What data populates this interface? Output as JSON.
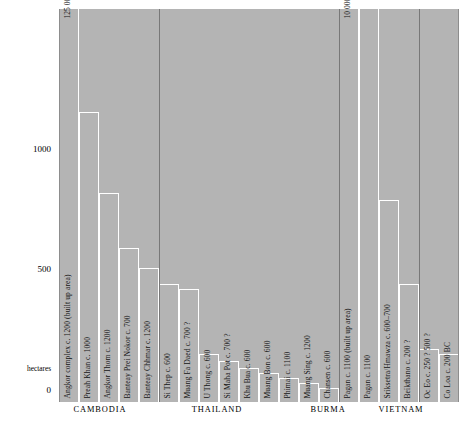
{
  "chart_data": {
    "type": "bar",
    "title": "",
    "xlabel": "",
    "ylabel": "hectares",
    "ylim": [
      0,
      1300
    ],
    "yticks": [
      0,
      500,
      1000
    ],
    "ytick_labels": [
      "0",
      "500",
      "1000"
    ],
    "grid": false,
    "legend": null,
    "categories": [
      "Angkor complex c. 1200  (built up area)",
      "Preah Khan c. 1000",
      "Angkor Thom c. 1200",
      "Banteay Prei Nokor c. 700",
      "Banteay Chhmar c. 1200",
      "Si Thep c. 600",
      "Muang Fa Daed c. 700 ?",
      "U Thong c. 600",
      "Si Maha Pot c. 700 ?",
      "Khu Bua c. 600",
      "Muang Bon c. 600",
      "Phimai c. 1100",
      "Muang Sing c. 1200",
      "Chansen c. 600",
      "Pagan c. 1100  (built up area)",
      "Pagan c. 1100",
      "Sriksetra/Hmawza c. 600–700",
      "Beikthano c. 200 ?",
      "Oc Eo c. 250 ? 500 ?",
      "Co Loa c. 200 BC"
    ],
    "values": [
      1300,
      1210,
      870,
      640,
      560,
      490,
      470,
      200,
      170,
      140,
      120,
      100,
      80,
      60,
      1300,
      1300,
      840,
      490,
      220,
      200
    ],
    "values_note": "Bar heights in hectares read from the axis; the two arrow-annotated bars run off the top of the plot.",
    "annotations": [
      {
        "text": "125 000 hectares→",
        "target": "Angkor complex c. 1200  (built up area)"
      },
      {
        "text": "10 000 hectares→",
        "target": "Pagan c. 1100  (built up area)"
      }
    ],
    "groups": [
      {
        "name": "CAMBODIA",
        "count": 5
      },
      {
        "name": "THAILAND",
        "count": 9
      },
      {
        "name": "BURMA",
        "count": 4
      },
      {
        "name": "VIETNAM",
        "count": 2
      }
    ],
    "colors": {
      "plot_background": "#b4b4b4",
      "bar_outline": "#ffffff",
      "separator": "#787878",
      "text": "#141414",
      "page_background": "#ffffff"
    }
  },
  "axis": {
    "y_title": "hectares",
    "tick_0": "0",
    "tick_500": "500",
    "tick_1000": "1000"
  },
  "annotations": {
    "angkor": "125 000 hectares→",
    "pagan": "10 000 hectares→"
  },
  "groups": {
    "cambodia": "CAMBODIA",
    "thailand": "THAILAND",
    "burma": "BURMA",
    "vietnam": "VIETNAM"
  },
  "bars": [
    {
      "label": "Angkor complex c. 1200  (built up area)"
    },
    {
      "label": "Preah Khan c. 1000"
    },
    {
      "label": "Angkor Thom c. 1200"
    },
    {
      "label": "Banteay Prei Nokor c. 700"
    },
    {
      "label": "Banteay Chhmar c. 1200"
    },
    {
      "label": "Si Thep c. 600"
    },
    {
      "label": "Muang Fa Daed c. 700 ?"
    },
    {
      "label": "U Thong c. 600"
    },
    {
      "label": "Si Maha Pot c. 700 ?"
    },
    {
      "label": "Khu Bua c. 600"
    },
    {
      "label": "Muang Bon c. 600"
    },
    {
      "label": "Phimai c. 1100"
    },
    {
      "label": "Muang Sing c. 1200"
    },
    {
      "label": "Chansen c. 600"
    },
    {
      "label": "Pagan c. 1100  (built up area)"
    },
    {
      "label": "Pagan c. 1100"
    },
    {
      "label": "Sriksetra/Hmawza c. 600–700"
    },
    {
      "label": "Beikthano c. 200 ?"
    },
    {
      "label": "Oc Eo c. 250 ? 500 ?"
    },
    {
      "label": "Co Loa c. 200 BC"
    }
  ]
}
